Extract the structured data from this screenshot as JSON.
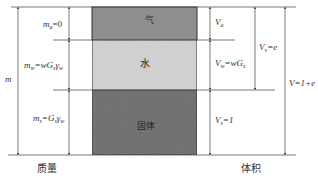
{
  "diagram": {
    "type": "soil three-phase diagram",
    "phases": [
      {
        "name": "air",
        "label": "气",
        "color": "#8c8c8c"
      },
      {
        "name": "water",
        "label": "水",
        "color": "#d2d2d2"
      },
      {
        "name": "solids",
        "label": "固体",
        "color": "#6a6a6a"
      }
    ],
    "mass_side": {
      "title": "质量",
      "total": {
        "symbol": "m",
        "label": "m"
      },
      "items": [
        {
          "phase": "air",
          "label_main": "m",
          "label_sub": "a",
          "label_rest": "=0"
        },
        {
          "phase": "water",
          "label_main": "m",
          "label_sub": "w",
          "label_rest": "=wG",
          "label_sub2": "s",
          "label_rest2": "γ",
          "label_sub3": "w"
        },
        {
          "phase": "solids",
          "label_main": "m",
          "label_sub": "s",
          "label_rest": "=G",
          "label_sub2": "s",
          "label_rest2": "γ",
          "label_sub3": "w"
        }
      ]
    },
    "volume_side": {
      "title": "体积",
      "items": [
        {
          "phase": "air",
          "label_main": "V",
          "label_sub": "a",
          "label_rest": ""
        },
        {
          "phase": "water",
          "label_main": "V",
          "label_sub": "w",
          "label_rest": "=wG",
          "label_sub2": "s"
        },
        {
          "phase": "solids",
          "label_main": "V",
          "label_sub": "s",
          "label_rest": "=1"
        }
      ],
      "voids": {
        "label_main": "V",
        "label_sub": "v",
        "label_rest": "=e"
      },
      "total": {
        "label_main": "V",
        "label_rest": "=1+e"
      }
    },
    "line_color": "#555555"
  }
}
